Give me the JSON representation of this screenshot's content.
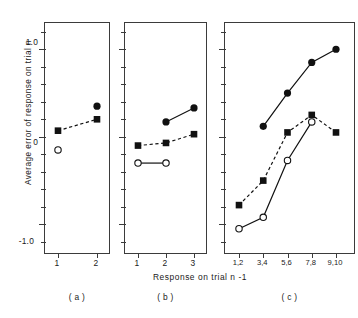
{
  "figure": {
    "ylabel": "Average error of response on trial n",
    "xlabel": "Response on trial  n -1",
    "panel_labels": [
      "( a )",
      "( b )",
      "( c )"
    ]
  },
  "axis": {
    "y_tick_labels": [
      "1.0",
      "0",
      "-1.0"
    ],
    "y_min": -1.35,
    "y_max": 1.3,
    "y_major_values": [
      1.0,
      0,
      -1.0
    ],
    "y_minor_step": 0.2
  },
  "chart_data": [
    {
      "type": "line",
      "panel": "( a )",
      "title": "",
      "xlabel": "Response on trial  n -1",
      "ylabel": "Average error of response on trial n",
      "categories": [
        "1",
        "2"
      ],
      "ylim": [
        -1.35,
        1.3
      ],
      "grid": false,
      "legend": "none",
      "series": [
        {
          "name": "filled-circle",
          "marker": "filled-circle",
          "line": "none",
          "x": [
            "2"
          ],
          "values": [
            0.35
          ]
        },
        {
          "name": "filled-square",
          "marker": "filled-square",
          "line": "dashed",
          "x": [
            "1",
            "2"
          ],
          "values": [
            0.07,
            0.2
          ]
        },
        {
          "name": "open-circle",
          "marker": "open-circle",
          "line": "none",
          "x": [
            "1"
          ],
          "values": [
            -0.15
          ]
        }
      ]
    },
    {
      "type": "line",
      "panel": "( b )",
      "title": "",
      "xlabel": "Response on trial  n -1",
      "ylabel": "Average error of response on trial n",
      "categories": [
        "1",
        "2",
        "3"
      ],
      "ylim": [
        -1.35,
        1.3
      ],
      "grid": false,
      "legend": "none",
      "series": [
        {
          "name": "filled-circle",
          "marker": "filled-circle",
          "line": "solid",
          "x": [
            "2",
            "3"
          ],
          "values": [
            0.17,
            0.33
          ]
        },
        {
          "name": "filled-square",
          "marker": "filled-square",
          "line": "dashed",
          "x": [
            "1",
            "2",
            "3"
          ],
          "values": [
            -0.1,
            -0.07,
            0.03
          ]
        },
        {
          "name": "open-circle",
          "marker": "open-circle",
          "line": "solid",
          "x": [
            "1",
            "2"
          ],
          "values": [
            -0.3,
            -0.3
          ]
        }
      ]
    },
    {
      "type": "line",
      "panel": "( c )",
      "title": "",
      "xlabel": "Response on trial  n -1",
      "ylabel": "Average error of response on trial n",
      "categories": [
        "1,2",
        "3,4",
        "5,6",
        "7,8",
        "9,10"
      ],
      "ylim": [
        -1.35,
        1.3
      ],
      "grid": false,
      "legend": "none",
      "series": [
        {
          "name": "filled-circle",
          "marker": "filled-circle",
          "line": "solid",
          "x": [
            "3,4",
            "5,6",
            "7,8",
            "9,10"
          ],
          "values": [
            0.12,
            0.5,
            0.85,
            1.0
          ]
        },
        {
          "name": "filled-square",
          "marker": "filled-square",
          "line": "dashed",
          "x": [
            "1,2",
            "3,4",
            "5,6",
            "7,8",
            "9,10"
          ],
          "values": [
            -0.78,
            -0.5,
            0.05,
            0.25,
            0.05
          ]
        },
        {
          "name": "open-circle",
          "marker": "open-circle",
          "line": "solid",
          "x": [
            "1,2",
            "3,4",
            "5,6",
            "7,8"
          ],
          "values": [
            -1.05,
            -0.92,
            -0.27,
            0.17
          ]
        }
      ]
    }
  ]
}
